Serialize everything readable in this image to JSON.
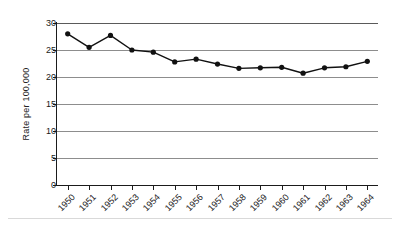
{
  "chart_data": {
    "type": "line",
    "title": "",
    "xlabel": "",
    "ylabel": "Rate per 100,000",
    "categories": [
      "1950",
      "1951",
      "1952",
      "1953",
      "1954",
      "1955",
      "1956",
      "1957",
      "1958",
      "1959",
      "1960",
      "1961",
      "1962",
      "1963",
      "1964"
    ],
    "values": [
      28.0,
      25.5,
      27.7,
      25.0,
      24.6,
      22.8,
      23.3,
      22.4,
      21.6,
      21.7,
      21.8,
      20.7,
      21.7,
      21.9,
      22.9
    ],
    "series": [
      {
        "name": "Rate per 100,000",
        "values": [
          28.0,
          25.5,
          27.7,
          25.0,
          24.6,
          22.8,
          23.3,
          22.4,
          21.6,
          21.7,
          21.8,
          20.7,
          21.7,
          21.9,
          22.9
        ]
      }
    ],
    "ylim": [
      0,
      30
    ],
    "yticks": [
      "0",
      "5",
      "10",
      "15",
      "20",
      "25",
      "30"
    ],
    "ytick_values": [
      0,
      5,
      10,
      15,
      20,
      25,
      30
    ],
    "grid": "horizontal",
    "legend": "none",
    "marker": "filled-circle",
    "line_color": "#111111",
    "grid_color": "#8d8d8d",
    "axis_color": "#1b1b1b",
    "background_color": "#ffffff",
    "xtick_label_rotation": "-45"
  },
  "axes": {
    "y_title": "Rate per 100,000",
    "y_tick_labels": [
      "30",
      "25",
      "20",
      "15",
      "10",
      "5",
      "0"
    ],
    "x_tick_labels": [
      "1950",
      "1951",
      "1952",
      "1953",
      "1954",
      "1955",
      "1956",
      "1957",
      "1958",
      "1959",
      "1960",
      "1961",
      "1962",
      "1963",
      "1964"
    ]
  }
}
